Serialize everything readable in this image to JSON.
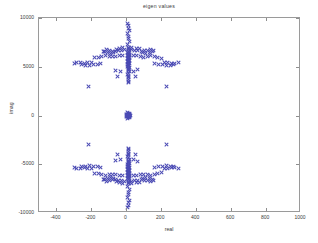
{
  "chart_data": {
    "type": "scatter",
    "title": "eigen values",
    "xlabel": "real",
    "ylabel": "imag",
    "xlim": [
      -500,
      1000
    ],
    "ylim": [
      -10000,
      10000
    ],
    "grid": false,
    "legend": null,
    "marker": "x",
    "marker_color": "#4b4bb4",
    "xticks": [
      -400,
      -200,
      0,
      200,
      400,
      600,
      800,
      1000
    ],
    "xticklabels": [
      "-400",
      "-200",
      "0",
      "200",
      "400",
      "600",
      "800",
      "1000"
    ],
    "yticks": [
      -10000,
      -5000,
      0,
      5000,
      10000
    ],
    "yticklabels": [
      "-10000",
      "-5000",
      "0",
      "5000",
      "10000"
    ],
    "series": [
      {
        "name": "eigenvalues",
        "points": [
          [
            8,
            9450
          ],
          [
            14,
            9200
          ],
          [
            9,
            8950
          ],
          [
            16,
            8700
          ],
          [
            7,
            8450
          ],
          [
            12,
            8150
          ],
          [
            10,
            7850
          ],
          [
            15,
            7550
          ],
          [
            8,
            7280
          ],
          [
            13,
            7020
          ],
          [
            11,
            6850
          ],
          [
            17,
            6700
          ],
          [
            9,
            6600
          ],
          [
            14,
            6520
          ],
          [
            7,
            6450
          ],
          [
            12,
            6380
          ],
          [
            16,
            6300
          ],
          [
            10,
            6240
          ],
          [
            8,
            6180
          ],
          [
            15,
            6120
          ],
          [
            11,
            6060
          ],
          [
            13,
            6000
          ],
          [
            9,
            5950
          ],
          [
            17,
            5900
          ],
          [
            7,
            5850
          ],
          [
            12,
            5800
          ],
          [
            14,
            5740
          ],
          [
            10,
            5680
          ],
          [
            16,
            5620
          ],
          [
            8,
            5560
          ],
          [
            11,
            5500
          ],
          [
            13,
            5440
          ],
          [
            9,
            5380
          ],
          [
            15,
            5320
          ],
          [
            7,
            5260
          ],
          [
            12,
            5200
          ],
          [
            10,
            5140
          ],
          [
            14,
            5080
          ],
          [
            8,
            5010
          ],
          [
            16,
            4950
          ],
          [
            11,
            4870
          ],
          [
            13,
            4790
          ],
          [
            9,
            4700
          ],
          [
            12,
            4600
          ],
          [
            15,
            4480
          ],
          [
            10,
            4350
          ],
          [
            8,
            4200
          ],
          [
            14,
            4050
          ],
          [
            11,
            3880
          ],
          [
            13,
            3700
          ],
          [
            9,
            3520
          ],
          [
            12,
            3350
          ],
          [
            -10,
            6740
          ],
          [
            -28,
            6700
          ],
          [
            -45,
            6620
          ],
          [
            -62,
            6520
          ],
          [
            -80,
            6560
          ],
          [
            -96,
            6660
          ],
          [
            -115,
            6720
          ],
          [
            -134,
            6600
          ],
          [
            -56,
            6780
          ],
          [
            -38,
            6840
          ],
          [
            -72,
            6420
          ],
          [
            -90,
            6380
          ],
          [
            -108,
            6460
          ],
          [
            -126,
            6540
          ],
          [
            30,
            6760
          ],
          [
            48,
            6700
          ],
          [
            66,
            6620
          ],
          [
            84,
            6540
          ],
          [
            102,
            6620
          ],
          [
            120,
            6700
          ],
          [
            138,
            6760
          ],
          [
            156,
            6640
          ],
          [
            58,
            6840
          ],
          [
            76,
            6880
          ],
          [
            94,
            6420
          ],
          [
            112,
            6380
          ],
          [
            130,
            6460
          ],
          [
            148,
            6540
          ],
          [
            -20,
            6200
          ],
          [
            -40,
            6140
          ],
          [
            -60,
            6080
          ],
          [
            -78,
            6020
          ],
          [
            -98,
            6100
          ],
          [
            -118,
            6160
          ],
          [
            -140,
            6100
          ],
          [
            -160,
            5980
          ],
          [
            -180,
            5900
          ],
          [
            38,
            6180
          ],
          [
            58,
            6120
          ],
          [
            78,
            6060
          ],
          [
            98,
            6000
          ],
          [
            118,
            6080
          ],
          [
            138,
            6140
          ],
          [
            158,
            6080
          ],
          [
            178,
            5960
          ],
          [
            198,
            5880
          ],
          [
            -200,
            5480
          ],
          [
            -222,
            5420
          ],
          [
            -240,
            5340
          ],
          [
            -262,
            5400
          ],
          [
            -284,
            5460
          ],
          [
            -300,
            5380
          ],
          [
            -258,
            5250
          ],
          [
            -236,
            5180
          ],
          [
            -212,
            5120
          ],
          [
            -190,
            5200
          ],
          [
            -168,
            5280
          ],
          [
            -146,
            5340
          ],
          [
            218,
            5460
          ],
          [
            238,
            5400
          ],
          [
            258,
            5320
          ],
          [
            278,
            5380
          ],
          [
            298,
            5440
          ],
          [
            272,
            5250
          ],
          [
            250,
            5180
          ],
          [
            228,
            5120
          ],
          [
            206,
            5200
          ],
          [
            184,
            5280
          ],
          [
            162,
            5340
          ],
          [
            -220,
            2950
          ],
          [
            230,
            2950
          ],
          [
            -60,
            4650
          ],
          [
            -36,
            4520
          ],
          [
            40,
            4560
          ],
          [
            64,
            4680
          ],
          [
            -50,
            3950
          ],
          [
            54,
            3980
          ],
          [
            -24,
            7000
          ],
          [
            28,
            7020
          ],
          [
            4,
            300
          ],
          [
            10,
            250
          ],
          [
            16,
            200
          ],
          [
            6,
            150
          ],
          [
            12,
            100
          ],
          [
            18,
            60
          ],
          [
            8,
            20
          ],
          [
            14,
            -20
          ],
          [
            10,
            -60
          ],
          [
            16,
            -100
          ],
          [
            6,
            -150
          ],
          [
            12,
            -200
          ],
          [
            18,
            -250
          ],
          [
            8,
            -300
          ],
          [
            2,
            120
          ],
          [
            20,
            120
          ],
          [
            2,
            -120
          ],
          [
            20,
            -120
          ],
          [
            5,
            0
          ],
          [
            11,
            0
          ],
          [
            17,
            0
          ],
          [
            23,
            0
          ],
          [
            -1,
            0
          ],
          [
            8,
            -9450
          ],
          [
            14,
            -9200
          ],
          [
            9,
            -8950
          ],
          [
            16,
            -8700
          ],
          [
            7,
            -8450
          ],
          [
            12,
            -8150
          ],
          [
            10,
            -7850
          ],
          [
            15,
            -7550
          ],
          [
            8,
            -7280
          ],
          [
            13,
            -7020
          ],
          [
            11,
            -6850
          ],
          [
            17,
            -6700
          ],
          [
            9,
            -6600
          ],
          [
            14,
            -6520
          ],
          [
            7,
            -6450
          ],
          [
            12,
            -6380
          ],
          [
            16,
            -6300
          ],
          [
            10,
            -6240
          ],
          [
            8,
            -6180
          ],
          [
            15,
            -6120
          ],
          [
            11,
            -6060
          ],
          [
            13,
            -6000
          ],
          [
            9,
            -5950
          ],
          [
            17,
            -5900
          ],
          [
            7,
            -5850
          ],
          [
            12,
            -5800
          ],
          [
            14,
            -5740
          ],
          [
            10,
            -5680
          ],
          [
            16,
            -5620
          ],
          [
            8,
            -5560
          ],
          [
            11,
            -5500
          ],
          [
            13,
            -5440
          ],
          [
            9,
            -5380
          ],
          [
            15,
            -5320
          ],
          [
            7,
            -5260
          ],
          [
            12,
            -5200
          ],
          [
            10,
            -5140
          ],
          [
            14,
            -5080
          ],
          [
            8,
            -5010
          ],
          [
            16,
            -4950
          ],
          [
            11,
            -4870
          ],
          [
            13,
            -4790
          ],
          [
            9,
            -4700
          ],
          [
            12,
            -4600
          ],
          [
            15,
            -4480
          ],
          [
            10,
            -4350
          ],
          [
            8,
            -4200
          ],
          [
            14,
            -4050
          ],
          [
            11,
            -3880
          ],
          [
            13,
            -3700
          ],
          [
            9,
            -3520
          ],
          [
            12,
            -3350
          ],
          [
            -10,
            -6740
          ],
          [
            -28,
            -6700
          ],
          [
            -45,
            -6620
          ],
          [
            -62,
            -6520
          ],
          [
            -80,
            -6560
          ],
          [
            -96,
            -6660
          ],
          [
            -115,
            -6720
          ],
          [
            -134,
            -6600
          ],
          [
            -56,
            -6780
          ],
          [
            -38,
            -6840
          ],
          [
            -72,
            -6420
          ],
          [
            -90,
            -6380
          ],
          [
            -108,
            -6460
          ],
          [
            -126,
            -6540
          ],
          [
            30,
            -6760
          ],
          [
            48,
            -6700
          ],
          [
            66,
            -6620
          ],
          [
            84,
            -6540
          ],
          [
            102,
            -6620
          ],
          [
            120,
            -6700
          ],
          [
            138,
            -6760
          ],
          [
            156,
            -6640
          ],
          [
            58,
            -6840
          ],
          [
            76,
            -6880
          ],
          [
            94,
            -6420
          ],
          [
            112,
            -6380
          ],
          [
            130,
            -6460
          ],
          [
            148,
            -6540
          ],
          [
            -20,
            -6200
          ],
          [
            -40,
            -6140
          ],
          [
            -60,
            -6080
          ],
          [
            -78,
            -6020
          ],
          [
            -98,
            -6100
          ],
          [
            -118,
            -6160
          ],
          [
            -140,
            -6100
          ],
          [
            -160,
            -5980
          ],
          [
            -180,
            -5900
          ],
          [
            38,
            -6180
          ],
          [
            58,
            -6120
          ],
          [
            78,
            -6060
          ],
          [
            98,
            -6000
          ],
          [
            118,
            -6080
          ],
          [
            138,
            -6140
          ],
          [
            158,
            -6080
          ],
          [
            178,
            -5960
          ],
          [
            198,
            -5880
          ],
          [
            -200,
            -5480
          ],
          [
            -222,
            -5420
          ],
          [
            -240,
            -5340
          ],
          [
            -262,
            -5400
          ],
          [
            -284,
            -5460
          ],
          [
            -300,
            -5380
          ],
          [
            -258,
            -5250
          ],
          [
            -236,
            -5180
          ],
          [
            -212,
            -5120
          ],
          [
            -190,
            -5200
          ],
          [
            -168,
            -5280
          ],
          [
            -146,
            -5340
          ],
          [
            218,
            -5460
          ],
          [
            238,
            -5400
          ],
          [
            258,
            -5320
          ],
          [
            278,
            -5380
          ],
          [
            298,
            -5440
          ],
          [
            272,
            -5250
          ],
          [
            250,
            -5180
          ],
          [
            228,
            -5120
          ],
          [
            206,
            -5200
          ],
          [
            184,
            -5280
          ],
          [
            162,
            -5340
          ],
          [
            -220,
            -2950
          ],
          [
            230,
            -2950
          ],
          [
            -60,
            -4650
          ],
          [
            -36,
            -4520
          ],
          [
            40,
            -4560
          ],
          [
            64,
            -4680
          ],
          [
            -50,
            -3950
          ],
          [
            54,
            -3980
          ],
          [
            -24,
            -7000
          ],
          [
            28,
            -7020
          ]
        ]
      }
    ]
  }
}
